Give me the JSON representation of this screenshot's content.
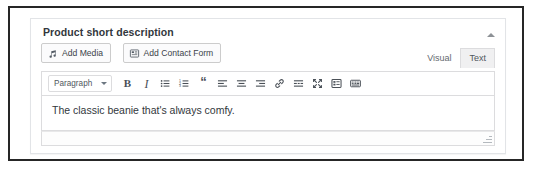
{
  "panel": {
    "title": "Product short description",
    "collapse_icon": "triangle-up-icon"
  },
  "media_buttons": [
    {
      "label": "Add Media",
      "icon": "insert-media-icon"
    },
    {
      "label": "Add Contact Form",
      "icon": "contact-form-icon"
    }
  ],
  "editor_tabs": [
    {
      "label": "Visual",
      "active": false
    },
    {
      "label": "Text",
      "active": true
    }
  ],
  "toolbar": {
    "format_select": {
      "value": "Paragraph",
      "caret_icon": "chevron-down-icon"
    },
    "buttons": [
      {
        "name": "bold-button",
        "glyph": "B",
        "icon": "bold-icon"
      },
      {
        "name": "italic-button",
        "glyph": "I",
        "icon": "italic-icon"
      },
      {
        "name": "bullet-list-button",
        "glyph": "",
        "icon": "unordered-list-icon"
      },
      {
        "name": "numbered-list-button",
        "glyph": "",
        "icon": "ordered-list-icon"
      },
      {
        "name": "blockquote-button",
        "glyph": "“",
        "icon": "blockquote-icon"
      },
      {
        "name": "align-left-button",
        "glyph": "",
        "icon": "align-left-icon"
      },
      {
        "name": "align-center-button",
        "glyph": "",
        "icon": "align-center-icon"
      },
      {
        "name": "align-right-button",
        "glyph": "",
        "icon": "align-right-icon"
      },
      {
        "name": "insert-link-button",
        "glyph": "",
        "icon": "link-icon"
      },
      {
        "name": "read-more-button",
        "glyph": "",
        "icon": "read-more-icon"
      },
      {
        "name": "distraction-free-button",
        "glyph": "",
        "icon": "fullscreen-icon"
      },
      {
        "name": "toolbar-toggle-button",
        "glyph": "",
        "icon": "toolbar-toggle-icon"
      },
      {
        "name": "keyboard-shortcuts-button",
        "glyph": "",
        "icon": "keyboard-icon"
      }
    ]
  },
  "content": {
    "body_text": "The classic beanie that's always comfy."
  },
  "statusbar": {
    "resize_icon": "resize-handle-icon"
  },
  "colors": {
    "panel_border": "#e2e4e7",
    "toolbar_border": "#dcdcde",
    "text": "#32373c",
    "muted_text": "#646970",
    "active_tab_bg": "#f0f0f1",
    "frame": "#262626"
  }
}
